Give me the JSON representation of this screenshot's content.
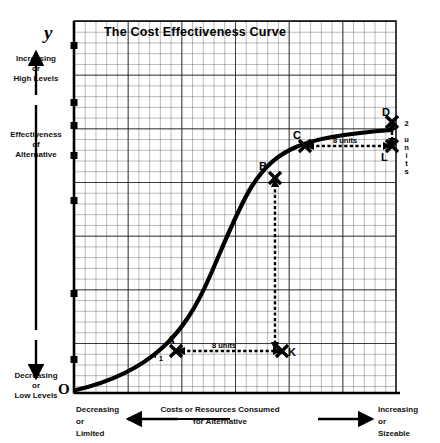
{
  "chart_data": {
    "type": "line",
    "title": "The Cost Effectiveness Curve",
    "xlabel": "Costs or Resources Consumed for Alternative",
    "ylabel": "Effectiveness of Alternative",
    "axis_letters": {
      "y": "y",
      "origin": "O"
    },
    "grid": true,
    "xlim": [
      0,
      30
    ],
    "ylim": [
      0,
      30
    ],
    "y_axis_notes": {
      "top": [
        "Increasing",
        "or",
        "High  Levels"
      ],
      "bottom": [
        "Decreasing",
        "or",
        "Low  Levels"
      ]
    },
    "x_axis_notes": {
      "left": [
        "Decreasing",
        "or",
        "Limited"
      ],
      "right": [
        "Increasing",
        "or",
        "Sizeable"
      ]
    },
    "series": [
      {
        "name": "Cost Effectiveness Curve",
        "shape": "s-curve",
        "x": [
          0,
          2,
          4,
          6,
          8,
          10,
          11,
          12,
          13,
          14,
          15,
          16,
          17,
          18,
          19,
          20,
          22,
          24,
          26,
          28,
          29.5
        ],
        "y": [
          0.3,
          0.8,
          1.5,
          2.4,
          3.6,
          5.4,
          6.6,
          8.2,
          10.3,
          12.8,
          15.2,
          17.4,
          19.2,
          20.6,
          21.6,
          22.4,
          23.4,
          24.0,
          24.4,
          24.8,
          25.0
        ]
      }
    ],
    "points": [
      {
        "id": "A",
        "label": "A",
        "sublabel": "I₁",
        "x": 11.1,
        "y": 6.6
      },
      {
        "id": "B",
        "label": "B",
        "sublabel": "",
        "x": 17.3,
        "y": 19.6
      },
      {
        "id": "C",
        "label": "C",
        "sublabel": "",
        "x": 22.4,
        "y": 23.5
      },
      {
        "id": "D",
        "label": "D",
        "sublabel": "",
        "x": 29.0,
        "y": 25.0
      },
      {
        "id": "K",
        "label": "K",
        "sublabel": "",
        "x": 20.5,
        "y": 6.6
      },
      {
        "id": "L",
        "label": "L",
        "sublabel": "",
        "x": 29.0,
        "y": 23.5
      }
    ],
    "annotations": [
      {
        "id": "ak",
        "text": "8 units",
        "from": "A",
        "to": "K",
        "orientation": "horizontal"
      },
      {
        "id": "bk",
        "text": "10 units",
        "from": "B",
        "to": "K",
        "orientation": "vertical"
      },
      {
        "id": "cl",
        "text": "8 units",
        "from": "C",
        "to": "L",
        "orientation": "horizontal"
      },
      {
        "id": "dl",
        "text": "2 units",
        "from": "D",
        "to": "L",
        "orientation": "vertical"
      }
    ]
  }
}
